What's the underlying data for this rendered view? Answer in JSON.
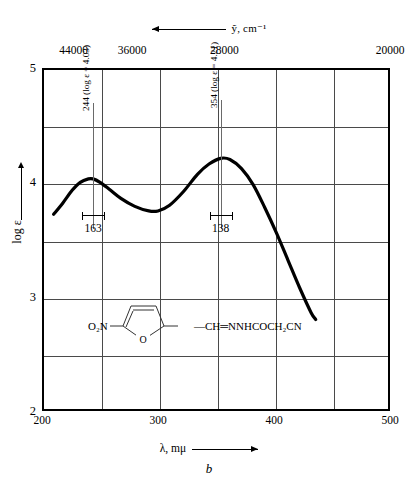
{
  "chart_data": {
    "type": "line",
    "title": "",
    "figure_letter": "b",
    "xlabel": "λ, mμ",
    "ylabel": "log ε",
    "top_axis_label": "ỹ, cm⁻¹",
    "xlim": [
      200,
      500
    ],
    "ylim": [
      2,
      5
    ],
    "grid": true,
    "x_ticks": [
      "200",
      "300",
      "400",
      "500"
    ],
    "x_tick_values": [
      200,
      300,
      400,
      500
    ],
    "x_gridlines": [
      250,
      300,
      350,
      400,
      450
    ],
    "y_ticks": [
      "2",
      "3",
      "4",
      "5"
    ],
    "y_tick_values": [
      2,
      3,
      4,
      5
    ],
    "y_gridlines": [
      2.5,
      3,
      3.5,
      4,
      4.5
    ],
    "top_ticks": [
      "44000",
      "36000",
      "28000",
      "20000"
    ],
    "top_tick_values": [
      44000,
      36000,
      28000,
      20000
    ],
    "top_minor_ticks": [
      48000,
      44000,
      40000,
      36000,
      32000,
      28000,
      24000
    ],
    "legend": "",
    "series": [
      {
        "name": "absorption",
        "x": [
          210,
          218,
          226,
          233,
          240,
          244,
          250,
          258,
          268,
          280,
          292,
          300,
          310,
          322,
          334,
          344,
          354,
          362,
          372,
          382,
          392,
          402,
          412,
          422,
          432,
          436
        ],
        "y": [
          3.72,
          3.82,
          3.93,
          4.0,
          4.03,
          4.03,
          4.0,
          3.94,
          3.86,
          3.79,
          3.75,
          3.75,
          3.8,
          3.92,
          4.07,
          4.16,
          4.21,
          4.2,
          4.12,
          3.98,
          3.78,
          3.56,
          3.32,
          3.08,
          2.86,
          2.8
        ]
      }
    ],
    "annotations": [
      {
        "id": "peak-1",
        "label": "244 (log ε = 4.03)",
        "wavelength": 244,
        "log_epsilon": 4.03,
        "bandwidth_label": "163",
        "bandwidth": 163
      },
      {
        "id": "peak-2",
        "label": "354 (log ε = 4.21)",
        "wavelength": 354,
        "log_epsilon": 4.21,
        "bandwidth_label": "138",
        "bandwidth": 138
      }
    ],
    "structure": {
      "left_formula": "O₂N",
      "right_formula": "—CH═NNHCOCH₂CN",
      "ring_label": "O",
      "ring_type": "furan"
    }
  }
}
